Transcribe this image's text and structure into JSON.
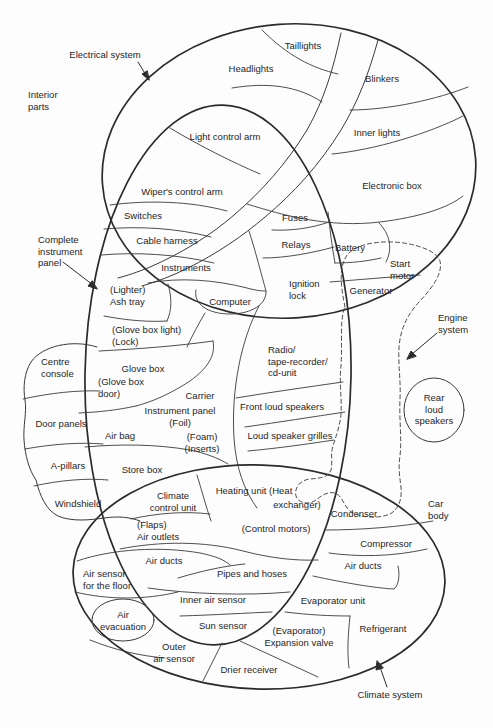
{
  "diagram_title": "Car component systems overlap diagram",
  "colors": {
    "line": "#2b2b2b",
    "thin_line": "#3a3a3a",
    "dashed_line": "#4a4a4a",
    "text": "#1f1f1f",
    "background": "#fdfdfd"
  },
  "labels": {
    "electrical_system": "Electrical system",
    "interior_parts": "Interior\nparts",
    "taillights": "Taillights",
    "headlights": "Headlights",
    "blinkers": "Blinkers",
    "inner_lights": "Inner lights",
    "light_control_arm": "Light control arm",
    "electronic_box": "Electronic box",
    "wipers_control_arm": "Wiper's control arm",
    "switches": "Switches",
    "fuses": "Fuses",
    "cable_harness": "Cable harness",
    "relays": "Relays",
    "battery": "Battery",
    "start_motor": "Start\nmotor",
    "complete_instrument_panel": "Complete\ninstrument\npanel",
    "instruments": "Instruments",
    "ignition_lock": "Ignition\nlock",
    "generator": "Generator",
    "lighter_ash_tray": "(Lighter)\nAsh tray",
    "computer": "Computer",
    "engine_system": "Engine\nsystem",
    "glove_box_light_lock": "(Glove box light)\n(Lock)",
    "radio_tape_cd": "Radio/\ntape-recorder/\ncd-unit",
    "centre_console": "Centre\nconsole",
    "glove_box": "Glove box",
    "glove_box_door": "(Glove box\ndoor)",
    "carrier": "Carrier",
    "instrument_panel_foil": "Instrument panel\n(Foil)",
    "foam_inserts": "(Foam)\n(Inserts)",
    "rear_loud_speakers": "Rear\nloud\nspeakers",
    "front_loud_speakers": "Front loud speakers",
    "door_panels": "Door panels",
    "air_bag": "Air bag",
    "loud_speaker_grilles": "Loud speaker grilles",
    "a_pillars": "A-pillars",
    "store_box": "Store box",
    "heating_unit_line1": "Heating unit (Heat",
    "heating_unit_line2": "exchanger)",
    "windshield": "Windshield",
    "climate_control_unit": "Climate\ncontrol unit",
    "condenser": "Condenser",
    "car_body": "Car\nbody",
    "flaps_air_outlets": "(Flaps)\nAir outlets",
    "control_motors": "(Control motors)",
    "compressor": "Compressor",
    "air_ducts_left": "Air ducts",
    "air_ducts_right": "Air ducts",
    "air_sensor_floor": "Air sensor\nfor the floor",
    "pipes_and_hoses": "Pipes and hoses",
    "inner_air_sensor": "Inner air sensor",
    "evaporator_unit": "Evaporator unit",
    "air_evacuation": "Air\nevacuation",
    "sun_sensor": "Sun sensor",
    "evaporator_expansion": "(Evaporator)\nExpansion valve",
    "refrigerant": "Refrigerant",
    "outer_air_sensor": "Outer\nair sensor",
    "drier_receiver": "Drier receiver",
    "climate_system": "Climate system"
  }
}
